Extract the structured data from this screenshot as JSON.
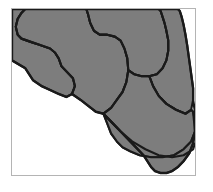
{
  "figure": {
    "kind": "map",
    "title": "Florida",
    "width": 213,
    "height": 192,
    "background_color": "#ffffff"
  },
  "frame": {
    "name": "map-border",
    "x": 11,
    "y": 8,
    "width": 185,
    "height": 168,
    "stroke_color": "#b4b4b4",
    "stroke_width": 1,
    "fill_color": "#ffffff"
  },
  "style": {
    "land_fill": "#7d7d7d",
    "land_fill_alt": "#808080",
    "boundary_color": "#1a1a1a",
    "boundary_width": 2.2,
    "water_fill": "#ffffff",
    "keys_stroke": "#1a1a1a",
    "keys_stroke_width": 1.6
  },
  "regions": [
    {
      "id": "northwest-panhandle",
      "label": "Northwest Panhandle",
      "fill": "#7d7d7d",
      "path": "M 0 0 L 0 52 L 14 60 L 22 72 L 31 78 L 40 82 L 49 86 L 57 89 L 63 86 L 66 78 L 64 70 L 58 64 L 52 58 L 49 50 L 45 44 L 40 40 L 34 38 L 28 36 L 22 34 L 16 32 L 10 30 L 6 26 L 4 18 L 6 10 L 10 4 L 14 0 Z"
    },
    {
      "id": "north-central-panhandle",
      "label": "North Central Panhandle",
      "fill": "#7d7d7d",
      "path": "M 14 0 L 10 4 L 6 10 L 4 18 L 6 26 L 10 30 L 16 32 L 22 34 L 28 36 L 34 38 L 40 40 L 45 44 L 49 50 L 52 58 L 58 64 L 64 70 L 66 78 L 63 86 L 72 92 L 80 98 L 88 104 L 96 106 L 104 100 L 110 92 L 116 84 L 120 74 L 122 62 L 121 50 L 118 40 L 114 32 L 108 28 L 100 26 L 92 26 L 86 22 L 82 14 L 80 6 L 78 0 Z"
    },
    {
      "id": "north-central",
      "label": "North Central Florida",
      "fill": "#7d7d7d",
      "path": "M 78 0 L 80 6 L 82 14 L 86 22 L 92 26 L 100 26 L 108 28 L 114 32 L 118 40 L 121 50 L 122 62 L 128 66 L 136 68 L 144 68 L 152 66 L 158 60 L 162 52 L 164 42 L 164 32 L 162 22 L 160 14 L 158 8 L 156 2 L 154 0 Z"
    },
    {
      "id": "northeast",
      "label": "Northeast Florida",
      "fill": "#7d7d7d",
      "path": "M 154 0 L 156 2 L 158 8 L 160 14 L 162 22 L 164 32 L 164 42 L 162 52 L 158 60 L 152 66 L 144 68 L 148 78 L 154 88 L 162 96 L 172 102 L 182 106 L 188 102 L 190 92 L 190 80 L 188 66 L 186 52 L 184 38 L 182 26 L 180 16 L 178 8 L 176 2 L 174 0 Z"
    },
    {
      "id": "central",
      "label": "Central Florida",
      "fill": "#7d7d7d",
      "path": "M 122 62 L 120 74 L 116 84 L 110 92 L 104 100 L 96 106 L 100 116 L 104 126 L 110 134 L 116 140 L 124 144 L 134 148 L 146 150 L 158 150 L 170 148 L 180 142 L 188 134 L 192 124 L 192 114 L 190 104 L 188 102 L 182 106 L 172 102 L 162 96 L 154 88 L 148 78 L 144 68 L 136 68 L 128 66 Z"
    },
    {
      "id": "south",
      "label": "South Florida",
      "fill": "#7d7d7d",
      "path": "M 96 106 L 100 116 L 104 126 L 110 134 L 116 140 L 124 144 L 134 148 L 146 150 L 158 150 L 170 148 L 180 142 L 188 134 L 192 124 L 192 114 L 190 104 L 192 124 L 190 136 L 186 146 L 180 154 L 174 160 L 168 164 L 162 166 L 156 166 L 150 164 L 146 160 L 142 154 L 138 148 L 132 142 L 126 136 L 120 130 L 114 124 L 108 118 L 102 112 Z"
    }
  ],
  "land_outline": {
    "id": "florida-outline",
    "label": "Florida state outline",
    "path": "M 0 0 L 174 0 L 176 2 L 178 8 L 180 16 L 182 26 L 184 38 L 186 52 L 188 66 L 190 80 L 190 92 L 192 104 L 192 124 L 190 136 L 186 146 L 180 154 L 174 160 L 168 164 L 162 166 L 156 166 L 150 164 L 146 160 L 142 154 L 138 148 L 132 142 L 126 136 L 120 130 L 114 124 L 108 118 L 102 112 L 96 106 L 88 104 L 80 98 L 72 92 L 63 86 L 57 89 L 49 86 L 40 82 L 31 78 L 22 72 L 14 60 L 0 52 Z"
  },
  "keys": {
    "id": "florida-keys",
    "label": "Florida Keys",
    "stroke": "#1a1a1a",
    "path": "M 160 172 L 152 175 L 146 178 L 142 181 L 143 184 L 148 185 L 154 183 L 160 180 L 165 176 L 166 173 L 163 171 Z"
  },
  "internal_boundaries": [
    {
      "id": "boundary-nw-ncp",
      "label": "Northwest to North Central Panhandle boundary",
      "path": "M 14 0 L 10 4 L 6 10 L 4 18 L 6 26 L 10 30 L 16 32 L 22 34 L 28 36 L 34 38 L 40 40 L 45 44 L 49 50 L 52 58 L 58 64 L 64 70 L 66 78 L 63 86"
    },
    {
      "id": "boundary-ncp-nc",
      "label": "North Central Panhandle to North Central boundary",
      "path": "M 78 0 L 80 6 L 82 14 L 86 22 L 92 26 L 100 26 L 108 28 L 114 32 L 118 40 L 121 50 L 122 62 L 120 74 L 116 84 L 110 92 L 104 100 L 96 106"
    },
    {
      "id": "boundary-nc-ne",
      "label": "North Central to Northeast boundary",
      "path": "M 154 0 L 156 2 L 158 8 L 160 14 L 162 22 L 164 32 L 164 42 L 162 52 L 158 60 L 152 66 L 144 68 L 136 68 L 128 66 L 122 62"
    },
    {
      "id": "boundary-ne-central",
      "label": "Northeast to Central boundary",
      "path": "M 144 68 L 148 78 L 154 88 L 162 96 L 172 102 L 182 106 L 188 102 L 190 104"
    },
    {
      "id": "boundary-central-south",
      "label": "Central to South boundary",
      "path": "M 96 106 L 104 114 L 114 124 L 126 134 L 140 142 L 154 148 L 168 150 L 180 148 L 190 142 L 192 136"
    }
  ],
  "legend": {
    "visible": false,
    "entries": []
  },
  "annotations": []
}
